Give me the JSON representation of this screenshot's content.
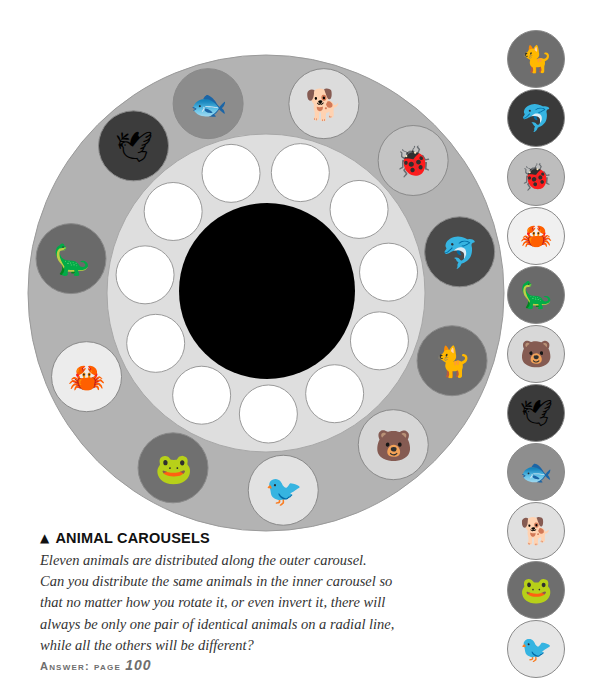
{
  "puzzle": {
    "title": "ANIMAL CAROUSELS",
    "title_icon": "triangle-up-icon",
    "body_lines": [
      "Eleven animals are distributed along the outer carousel.",
      "Can you distribute the same animals in the inner carousel so",
      "that no matter how you rotate it, or even invert it, there will",
      "always be only one pair of identical animals on a radial line,",
      "while all the others will be different?"
    ],
    "answer_label": "Answer: page",
    "answer_page": "100"
  },
  "outer_carousel": {
    "ring_color": "#b3b3b3",
    "animals": [
      {
        "name": "fish",
        "glyph": "🐟",
        "bg": "#8c8c8c"
      },
      {
        "name": "basset hound",
        "glyph": "🐕",
        "bg": "#dcdcdc"
      },
      {
        "name": "ladybug",
        "glyph": "🐞",
        "bg": "#c4c4c4"
      },
      {
        "name": "dolphin",
        "glyph": "🐬",
        "bg": "#4a4a4a"
      },
      {
        "name": "wildcat",
        "glyph": "🐈",
        "bg": "#6e6e6e"
      },
      {
        "name": "bear",
        "glyph": "🐻",
        "bg": "#d6d6d6"
      },
      {
        "name": "magpie",
        "glyph": "🐦",
        "bg": "#e2e2e2"
      },
      {
        "name": "frog",
        "glyph": "🐸",
        "bg": "#707070"
      },
      {
        "name": "crab",
        "glyph": "🦀",
        "bg": "#ececec"
      },
      {
        "name": "dinosaur",
        "glyph": "🦕",
        "bg": "#6a6a6a"
      },
      {
        "name": "gannet",
        "glyph": "🕊",
        "bg": "#3c3c3c"
      }
    ]
  },
  "inner_carousel": {
    "ring_color": "#dedede",
    "empty_slots": 11,
    "slot_color": "#ffffff",
    "hub_color": "#000000"
  },
  "side_column": {
    "animals": [
      {
        "name": "wildcat",
        "glyph": "🐈",
        "bg": "#6e6e6e"
      },
      {
        "name": "dolphin",
        "glyph": "🐬",
        "bg": "#3a3a3a"
      },
      {
        "name": "ladybug",
        "glyph": "🐞",
        "bg": "#bdbdbd"
      },
      {
        "name": "crab",
        "glyph": "🦀",
        "bg": "#f0f0f0"
      },
      {
        "name": "dinosaur",
        "glyph": "🦕",
        "bg": "#6a6a6a"
      },
      {
        "name": "bear",
        "glyph": "🐻",
        "bg": "#d8d8d8"
      },
      {
        "name": "gannet",
        "glyph": "🕊",
        "bg": "#3a3a3a"
      },
      {
        "name": "fish",
        "glyph": "🐟",
        "bg": "#8e8e8e"
      },
      {
        "name": "basset hound",
        "glyph": "🐕",
        "bg": "#e0e0e0"
      },
      {
        "name": "frog",
        "glyph": "🐸",
        "bg": "#6e6e6e"
      },
      {
        "name": "magpie",
        "glyph": "🐦",
        "bg": "#e6e6e6"
      }
    ]
  }
}
